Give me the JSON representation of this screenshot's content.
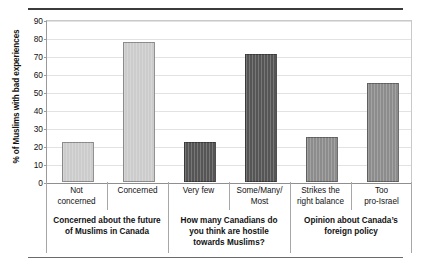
{
  "chart_data": {
    "type": "bar",
    "title": "",
    "xlabel": "",
    "ylabel": "% of Muslims with bad experiences",
    "ylim": [
      0,
      90
    ],
    "yticks": [
      0,
      10,
      20,
      30,
      40,
      50,
      60,
      70,
      80,
      90
    ],
    "grid": true,
    "legend": "none",
    "categories": [
      "Not concerned",
      "Concerned",
      "Very few",
      "Some/Many/Most",
      "Strikes the right balance",
      "Too pro-Israel"
    ],
    "values": [
      22,
      78,
      22,
      71,
      25,
      55
    ],
    "bar_colors": [
      "#cccccc",
      "#cccccc",
      "#555555",
      "#555555",
      "#8c8c8c",
      "#8c8c8c"
    ],
    "groups": [
      {
        "label": "Concerned about the future of Muslims in Canada",
        "categories": [
          "Not concerned",
          "Concerned"
        ],
        "values": [
          22,
          78
        ],
        "color": "#cccccc"
      },
      {
        "label": "How many Canadians do you think are hostile towards Muslims?",
        "categories": [
          "Very few",
          "Some/Many/Most"
        ],
        "values": [
          22,
          71
        ],
        "color": "#555555"
      },
      {
        "label": "Opinion about Canada’s foreign policy",
        "categories": [
          "Strikes the right balance",
          "Too pro-Israel"
        ],
        "values": [
          25,
          55
        ],
        "color": "#8c8c8c"
      }
    ]
  },
  "axis": {
    "y_title": "% of Muslims with bad experiences",
    "y_tick_labels": [
      "0",
      "10",
      "20",
      "30",
      "40",
      "50",
      "60",
      "70",
      "80",
      "90"
    ]
  },
  "cat_labels": [
    {
      "line1": "Not",
      "line2": "concerned"
    },
    {
      "line1": "Concerned",
      "line2": ""
    },
    {
      "line1": "Very few",
      "line2": ""
    },
    {
      "line1": "Some/Many/",
      "line2": "Most"
    },
    {
      "line1": "Strikes the",
      "line2": "right balance"
    },
    {
      "line1": "Too",
      "line2": "pro-Israel"
    }
  ],
  "group_labels": [
    {
      "line1": "Concerned about the future",
      "line2": "of Muslims in Canada",
      "line3": ""
    },
    {
      "line1": "How many Canadians do",
      "line2": "you think are hostile",
      "line3": "towards Muslims?"
    },
    {
      "line1": "Opinion about Canada’s",
      "line2": "foreign policy",
      "line3": ""
    }
  ],
  "colors": {
    "group1": "#cccccc",
    "group2": "#555555",
    "group3": "#8c8c8c",
    "gridline": "#e2e2e2",
    "axis": "#9a9a9a",
    "rule": "#3b3b3b"
  }
}
